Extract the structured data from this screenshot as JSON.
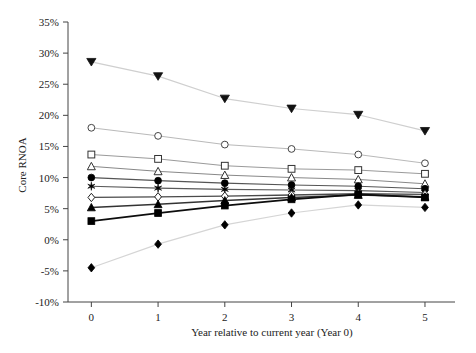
{
  "chart_data": {
    "type": "line",
    "title": "",
    "xlabel": "Year relative to current year (Year 0)",
    "ylabel": "Core RNOA",
    "x": [
      0,
      1,
      2,
      3,
      4,
      5
    ],
    "xtick_labels": [
      "0",
      "1",
      "2",
      "3",
      "4",
      "5"
    ],
    "ytick_labels": [
      "-10%",
      "-5%",
      "0%",
      "5%",
      "10%",
      "15%",
      "20%",
      "25%",
      "30%",
      "35%"
    ],
    "ytick_values": [
      -10,
      -5,
      0,
      5,
      10,
      15,
      20,
      25,
      30,
      35
    ],
    "xlim": [
      -0.35,
      5.45
    ],
    "ylim": [
      -10,
      35
    ],
    "grid": false,
    "legend": "none",
    "value_suffix": "%",
    "series": [
      {
        "name": "Portfolio 10",
        "marker": "triangle-down-filled",
        "color": "#cfcfcf",
        "marker_color": "#111111",
        "line_width": 1.2,
        "values": [
          28.6,
          26.3,
          22.7,
          21.1,
          20.1,
          17.5
        ]
      },
      {
        "name": "Portfolio 9",
        "marker": "circle-open",
        "color": "#b9b9b9",
        "marker_color": "#444444",
        "line_width": 1.0,
        "values": [
          18.0,
          16.7,
          15.3,
          14.6,
          13.7,
          12.3
        ]
      },
      {
        "name": "Portfolio 8",
        "marker": "square-open",
        "color": "#9a9a9a",
        "marker_color": "#333333",
        "line_width": 1.0,
        "values": [
          13.7,
          13.0,
          11.9,
          11.4,
          11.2,
          10.6
        ]
      },
      {
        "name": "Portfolio 7",
        "marker": "triangle-up-open",
        "color": "#888888",
        "marker_color": "#333333",
        "line_width": 1.0,
        "values": [
          11.8,
          11.0,
          10.4,
          10.0,
          9.7,
          9.0
        ]
      },
      {
        "name": "Portfolio 6",
        "marker": "circle-filled",
        "color": "#555555",
        "marker_color": "#000000",
        "line_width": 1.2,
        "values": [
          10.0,
          9.5,
          9.1,
          8.8,
          8.6,
          8.2
        ]
      },
      {
        "name": "Portfolio 5",
        "marker": "star",
        "color": "#5a5a5a",
        "marker_color": "#000000",
        "line_width": 1.2,
        "values": [
          8.6,
          8.3,
          8.1,
          8.0,
          7.9,
          7.6
        ]
      },
      {
        "name": "Portfolio 4",
        "marker": "diamond-open",
        "color": "#4a4a4a",
        "marker_color": "#222222",
        "line_width": 1.3,
        "values": [
          6.8,
          6.9,
          7.0,
          7.2,
          7.4,
          7.3
        ]
      },
      {
        "name": "Portfolio 3",
        "marker": "triangle-up-filled",
        "color": "#333333",
        "marker_color": "#000000",
        "line_width": 1.5,
        "values": [
          5.2,
          5.7,
          6.3,
          6.8,
          7.2,
          6.9
        ]
      },
      {
        "name": "Portfolio 2",
        "marker": "square-filled",
        "color": "#0d0d0d",
        "marker_color": "#000000",
        "line_width": 1.8,
        "values": [
          3.0,
          4.3,
          5.5,
          6.5,
          7.3,
          6.8
        ]
      },
      {
        "name": "Portfolio 1",
        "marker": "diamond-filled",
        "color": "#d5d5d5",
        "marker_color": "#000000",
        "line_width": 1.2,
        "values": [
          -4.5,
          -0.7,
          2.4,
          4.3,
          5.6,
          5.2
        ]
      }
    ]
  }
}
